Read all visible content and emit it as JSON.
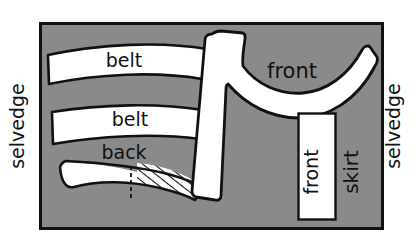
{
  "diagram": {
    "kind": "sewing-pattern-cutting-layout",
    "colors": {
      "fabric_gray": "#8a8a8a",
      "pattern_white": "#ffffff",
      "outline_black": "#111111",
      "page_background": "#ffffff"
    },
    "fabric": {
      "label": "fabric",
      "x": 40,
      "y": 23,
      "width": 343,
      "height": 206
    },
    "edge_labels": [
      {
        "id": "selvedge-left",
        "text": "selvedge",
        "rotation": -90,
        "x": 24,
        "y": 126,
        "font_size": 19
      },
      {
        "id": "selvedge-right",
        "text": "selvedge",
        "rotation": -90,
        "x": 400,
        "y": 126,
        "font_size": 19
      }
    ],
    "pieces": [
      {
        "id": "belt-upper",
        "label": "belt",
        "shape": "curved-band",
        "fill": "white",
        "label_x": 124,
        "label_y": 67,
        "label_rotation": 0,
        "font_size": 19
      },
      {
        "id": "belt-lower",
        "label": "belt",
        "shape": "curved-band",
        "fill": "white",
        "label_x": 130,
        "label_y": 126,
        "label_rotation": 0,
        "font_size": 19
      },
      {
        "id": "back",
        "label": "back",
        "shape": "crescent-half-hatched",
        "fill": "white-and-hatched",
        "label_x": 124,
        "label_y": 159,
        "label_rotation": 0,
        "font_size": 19,
        "hatched_half": "right",
        "fold_line": "dashed-vertical"
      },
      {
        "id": "front-bodice",
        "label": "front",
        "shape": "L-shaped-with-concave-curve",
        "fill": "white",
        "label_x": 292,
        "label_y": 78,
        "label_rotation": 0,
        "font_size": 21
      },
      {
        "id": "front-skirt-piece",
        "label": "front",
        "shape": "rectangle",
        "fill": "white",
        "x": 298,
        "y": 113,
        "width": 38,
        "height": 107,
        "label_x": 318,
        "label_y": 175,
        "label_rotation": -90,
        "font_size": 19
      },
      {
        "id": "front-skirt-outer",
        "label": "skirt",
        "shape": "text-only",
        "fill": "none",
        "label_x": 358,
        "label_y": 172,
        "label_rotation": -90,
        "font_size": 20
      }
    ]
  }
}
